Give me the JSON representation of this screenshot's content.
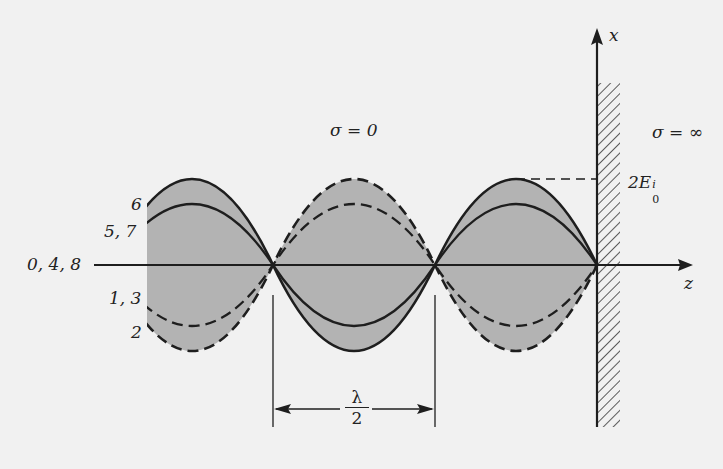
{
  "diagram": {
    "type": "standing-wave",
    "colors": {
      "background": "#f1f1f1",
      "envelope_fill": "#b3b3b3",
      "stroke": "#1e1e1e",
      "hatch": "#333333"
    },
    "axes": {
      "x_label": "x",
      "z_label": "z"
    },
    "regions": {
      "left_label": "σ = 0",
      "right_label": "σ = ∞"
    },
    "amplitude_label": {
      "base": "2E",
      "sup": "i",
      "sub": "0"
    },
    "wavelength_label": {
      "numerator": "λ",
      "denominator": "2"
    },
    "curve_labels": [
      {
        "id": "6",
        "text": "6",
        "style": "solid",
        "amplitude": 1.0
      },
      {
        "id": "5-7",
        "text": "5, 7",
        "style": "solid",
        "amplitude": 0.707
      },
      {
        "id": "0-4-8",
        "text": "0, 4, 8",
        "style": "solid",
        "amplitude": 0.0
      },
      {
        "id": "1-3",
        "text": "1, 3",
        "style": "dashed",
        "amplitude": -0.707
      },
      {
        "id": "2",
        "text": "2",
        "style": "dashed",
        "amplitude": -1.0
      }
    ],
    "nodes_x_px": [
      273,
      435,
      597
    ],
    "axis_y_px": 265
  }
}
